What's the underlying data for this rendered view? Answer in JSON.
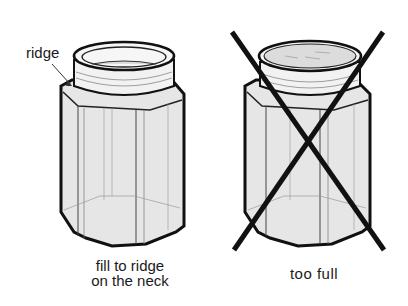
{
  "panels": [
    {
      "id": "correct",
      "callout": "ridge",
      "caption_line1": "fill to ridge",
      "caption_line2": "on the neck",
      "crossed_out": false
    },
    {
      "id": "incorrect",
      "caption_line1": "too full",
      "crossed_out": true
    }
  ],
  "colors": {
    "outline": "#111111",
    "jar_fill": "#e6e6e6",
    "neck_fill": "#f2f2f2",
    "liquid": "#dcdcdc",
    "cross": "#111111"
  }
}
